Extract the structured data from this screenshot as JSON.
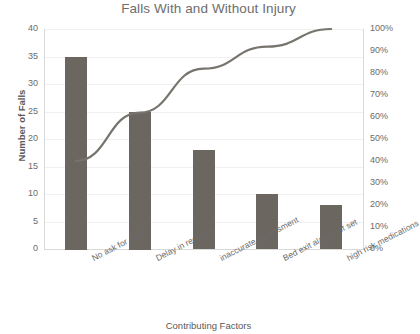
{
  "chart_data": {
    "type": "bar",
    "title": "Falls With and Without Injury",
    "xlabel": "Contributing Factors",
    "ylabel": "Number of Falls",
    "y2label": "",
    "categories": [
      "No ask for assist",
      "Delay in respose",
      "inaccurate assessment",
      "Bed exit alarm not set",
      "high risk medications"
    ],
    "series": [
      {
        "name": "Number of Falls",
        "type": "bar",
        "axis": "left",
        "values": [
          35,
          25,
          18,
          10,
          8
        ],
        "color": "#6b6660"
      },
      {
        "name": "Cumulative Percent",
        "type": "line",
        "axis": "right",
        "values": [
          40,
          62,
          82,
          92,
          100
        ],
        "color": "#77736d"
      }
    ],
    "ylim": [
      0,
      40
    ],
    "y_ticks": [
      0,
      5,
      10,
      15,
      20,
      25,
      30,
      35,
      40
    ],
    "y2lim": [
      0,
      100
    ],
    "y2_ticks": [
      "0%",
      "10%",
      "20%",
      "30%",
      "40%",
      "50%",
      "60%",
      "70%",
      "80%",
      "90%",
      "100%"
    ],
    "grid": true,
    "legend": "none"
  },
  "axes": {
    "left_ticks": [
      "0",
      "5",
      "10",
      "15",
      "20",
      "25",
      "30",
      "35",
      "40"
    ],
    "right_ticks": [
      "0%",
      "10%",
      "20%",
      "30%",
      "40%",
      "50%",
      "60%",
      "70%",
      "80%",
      "90%",
      "100%"
    ]
  },
  "colors": {
    "bar": "#6b6660",
    "line": "#77736d",
    "grid": "#f0f0f0",
    "axis": "#d9d9d9",
    "title_text": "#6d6d6d",
    "tick_text": "#6b6b6b"
  }
}
